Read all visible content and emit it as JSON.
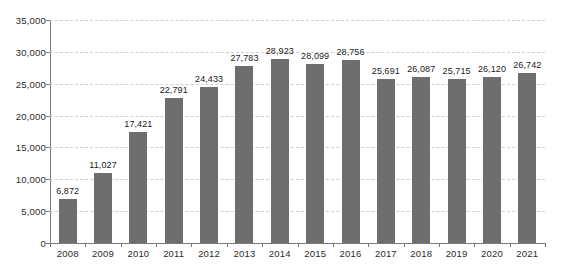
{
  "chart_data": {
    "type": "bar",
    "title": "",
    "subtitle": "",
    "xlabel": "",
    "ylabel": "",
    "categories": [
      "2008",
      "2009",
      "2010",
      "2011",
      "2012",
      "2013",
      "2014",
      "2015",
      "2016",
      "2017",
      "2018",
      "2019",
      "2020",
      "2021"
    ],
    "values": [
      6872,
      11027,
      17421,
      22791,
      24433,
      27783,
      28923,
      28099,
      28756,
      25691,
      26087,
      25715,
      26120,
      26742
    ],
    "value_labels": [
      "6,872",
      "11,027",
      "17,421",
      "22,791",
      "24,433",
      "27,783",
      "28,923",
      "28,099",
      "28,756",
      "25,691",
      "26,087",
      "25,715",
      "26,120",
      "26,742"
    ],
    "ylim": [
      0,
      35000
    ],
    "ytick_values": [
      0,
      5000,
      10000,
      15000,
      20000,
      25000,
      30000,
      35000
    ],
    "ytick_labels": [
      "0",
      "5,000",
      "10,000",
      "15,000",
      "20,000",
      "25,000",
      "30,000",
      "35,000"
    ],
    "grid": true,
    "grid_axis": "y",
    "legend": false,
    "legend_position": "none",
    "series": [
      {
        "name": "",
        "color": "#6e6e6e",
        "values": [
          6872,
          11027,
          17421,
          22791,
          24433,
          27783,
          28923,
          28099,
          28756,
          25691,
          26087,
          25715,
          26120,
          26742
        ]
      }
    ],
    "colors": {
      "bar": "#6e6e6e",
      "grid": "#cfcfcf",
      "axis": "#7a7a7a",
      "text": "#2b2b2b",
      "background": "#ffffff"
    }
  }
}
